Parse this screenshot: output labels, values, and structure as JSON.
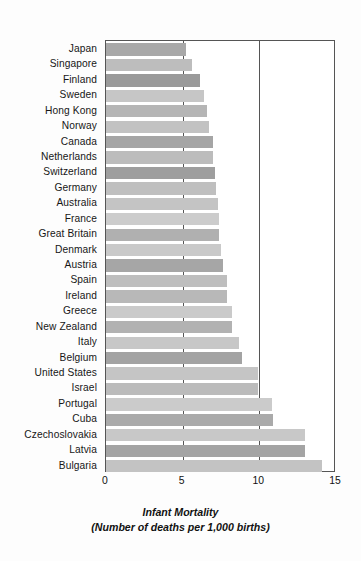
{
  "chart_data": {
    "type": "bar",
    "orientation": "horizontal",
    "title": "",
    "xlabel": "Infant Mortality",
    "xlabel_sub": "(Number of deaths per 1,000 births)",
    "ylabel": "",
    "xlim": [
      0,
      15
    ],
    "xticks": [
      0,
      5,
      10,
      15
    ],
    "xtick_labels": [
      "0",
      "5",
      "10",
      "15"
    ],
    "grid": true,
    "gridlines_at": [
      5,
      10
    ],
    "legend": null,
    "categories": [
      "Japan",
      "Singapore",
      "Finland",
      "Sweden",
      "Hong Kong",
      "Norway",
      "Canada",
      "Netherlands",
      "Switzerland",
      "Germany",
      "Australia",
      "France",
      "Great Britain",
      "Denmark",
      "Austria",
      "Spain",
      "Ireland",
      "Greece",
      "New Zealand",
      "Italy",
      "Belgium",
      "United States",
      "Israel",
      "Portugal",
      "Cuba",
      "Czechoslovakia",
      "Latvia",
      "Bulgaria"
    ],
    "values": [
      5.2,
      5.6,
      6.1,
      6.4,
      6.6,
      6.7,
      7.0,
      7.0,
      7.1,
      7.2,
      7.3,
      7.4,
      7.4,
      7.5,
      7.6,
      7.9,
      7.9,
      8.2,
      8.2,
      8.7,
      8.9,
      9.9,
      9.9,
      10.8,
      10.9,
      13.0,
      13.0,
      14.1
    ],
    "bar_colors": [
      "#a8a8a8",
      "#bdbdbd",
      "#9a9a9a",
      "#c6c6c6",
      "#b5b5b5",
      "#c2c2c2",
      "#a5a5a5",
      "#bcbcbc",
      "#9e9e9e",
      "#bfbfbf",
      "#c4c4c4",
      "#cccccc",
      "#b0b0b0",
      "#c9c9c9",
      "#a6a6a6",
      "#bebebe",
      "#b8b8b8",
      "#cacaca",
      "#b2b2b2",
      "#c7c7c7",
      "#a3a3a3",
      "#c5c5c5",
      "#bbbbbb",
      "#cbcbcb",
      "#aaaaaa",
      "#c8c8c8",
      "#a4a4a4",
      "#c3c3c3"
    ],
    "plot_border_color": "#555555",
    "background_color": "#fdfdfd"
  }
}
